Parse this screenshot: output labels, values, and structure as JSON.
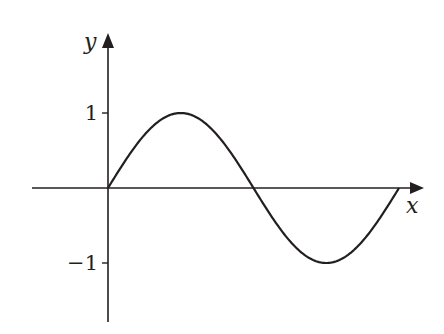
{
  "chart_data": {
    "type": "line",
    "title": "",
    "xlabel": "x",
    "ylabel": "y",
    "function": "sin(x)",
    "x_domain": [
      0,
      6.2832
    ],
    "xlim": [
      -2.4,
      9.6
    ],
    "ylim": [
      -1.75,
      2.0
    ],
    "yticks": [
      {
        "value": 1,
        "label": "1"
      },
      {
        "value": -1,
        "label": "−1"
      }
    ],
    "series": [
      {
        "name": "sine curve",
        "x": [
          0,
          0.7854,
          1.5708,
          2.3562,
          3.1416,
          3.927,
          4.7124,
          5.4978,
          6.2832
        ],
        "y": [
          0,
          0.7071,
          1,
          0.7071,
          0,
          -0.7071,
          -1,
          -0.7071,
          0
        ]
      }
    ],
    "grid": false,
    "legend": "none"
  },
  "colors": {
    "ink": "#231f20",
    "background": "#ffffff"
  }
}
